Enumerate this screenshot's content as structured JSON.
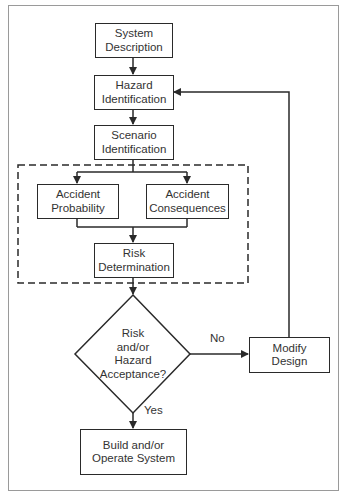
{
  "diagram": {
    "type": "flowchart",
    "nodes": {
      "system_description": {
        "line1": "System",
        "line2": "Description"
      },
      "hazard_identification": {
        "line1": "Hazard",
        "line2": "Identification"
      },
      "scenario_identification": {
        "line1": "Scenario",
        "line2": "Identification"
      },
      "accident_probability": {
        "line1": "Accident",
        "line2": "Probability"
      },
      "accident_consequences": {
        "line1": "Accident",
        "line2": "Consequences"
      },
      "risk_determination": {
        "line1": "Risk",
        "line2": "Determination"
      },
      "decision": {
        "line1": "Risk",
        "line2": "and/or",
        "line3": "Hazard",
        "line4": "Acceptance?"
      },
      "modify_design": {
        "line1": "Modify",
        "line2": "Design"
      },
      "build_operate": {
        "line1": "Build and/or",
        "line2": "Operate System"
      }
    },
    "edge_labels": {
      "no": "No",
      "yes": "Yes"
    },
    "colors": {
      "line": "#2a2a2a",
      "frame": "#9a9a9a",
      "text": "#333333"
    }
  }
}
